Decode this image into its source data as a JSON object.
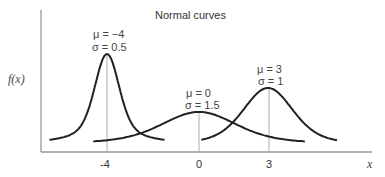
{
  "chart_data": {
    "type": "line",
    "title": "Normal curves",
    "xlabel": "x",
    "ylabel": "f(x)",
    "x_ticks": [
      "-4",
      "0",
      "3"
    ],
    "grid": false,
    "legend": "none (inline annotations)",
    "series": [
      {
        "name": "μ = −4, σ = 0.5",
        "mu": -4,
        "sigma": 0.5,
        "mu_label": "μ = −4",
        "sigma_label": "σ = 0.5"
      },
      {
        "name": "μ = 0, σ = 1.5",
        "mu": 0,
        "sigma": 1.5,
        "mu_label": "μ = 0",
        "sigma_label": "σ = 1.5"
      },
      {
        "name": "μ = 3, σ = 1",
        "mu": 3,
        "sigma": 1,
        "mu_label": "μ = 3",
        "sigma_label": "σ = 1"
      }
    ]
  }
}
